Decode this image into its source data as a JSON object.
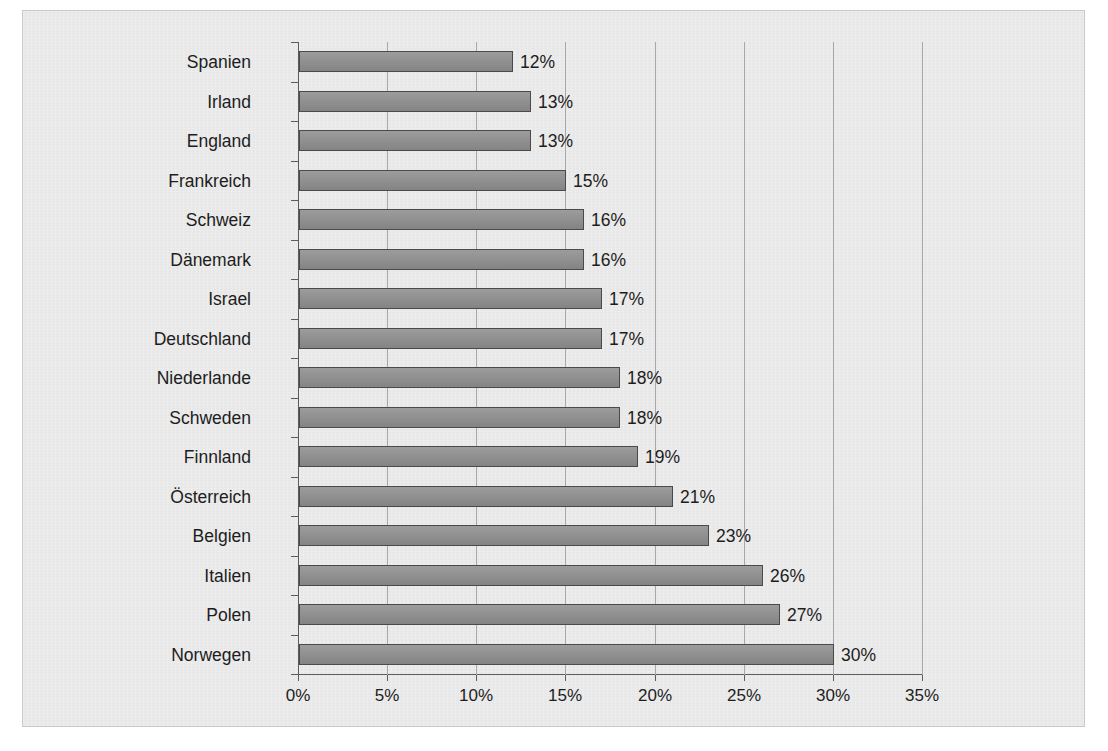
{
  "chart_data": {
    "type": "bar",
    "orientation": "horizontal",
    "title": "",
    "xlabel": "",
    "ylabel": "",
    "xlim": [
      0,
      35
    ],
    "xtick_labels": [
      "0%",
      "5%",
      "10%",
      "15%",
      "20%",
      "25%",
      "30%",
      "35%"
    ],
    "xtick_values": [
      0,
      5,
      10,
      15,
      20,
      25,
      30,
      35
    ],
    "grid": true,
    "legend": false,
    "categories": [
      "Spanien",
      "Irland",
      "England",
      "Frankreich",
      "Schweiz",
      "Dänemark",
      "Israel",
      "Deutschland",
      "Niederlande",
      "Schweden",
      "Finnland",
      "Österreich",
      "Belgien",
      "Italien",
      "Polen",
      "Norwegen"
    ],
    "values": [
      12,
      13,
      13,
      15,
      16,
      16,
      17,
      17,
      18,
      18,
      19,
      21,
      23,
      26,
      27,
      30
    ],
    "data_labels": [
      "12%",
      "13%",
      "13%",
      "15%",
      "16%",
      "16%",
      "17%",
      "17%",
      "18%",
      "18%",
      "19%",
      "21%",
      "23%",
      "26%",
      "27%",
      "30%"
    ],
    "colors": {
      "bar_fill": "#8c8c8c",
      "bar_outline": "#4a4a4a",
      "panel_background": "#e9e9e9",
      "gridline": "#a8a8a8",
      "axis": "#5c5c5c",
      "text": "#1d1d1d"
    }
  }
}
